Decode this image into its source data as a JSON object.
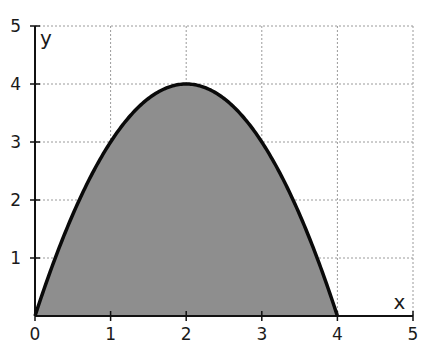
{
  "chart_data": {
    "type": "area",
    "title": "",
    "xlabel": "x",
    "ylabel": "y",
    "xlim": [
      0,
      5
    ],
    "ylim": [
      0,
      5
    ],
    "x_ticks": [
      0,
      1,
      2,
      3,
      4,
      5
    ],
    "y_ticks": [
      1,
      2,
      3,
      4,
      5
    ],
    "x_tick_labels": [
      "0",
      "1",
      "2",
      "3",
      "4",
      "5"
    ],
    "y_tick_labels": [
      "1",
      "2",
      "3",
      "4",
      "5"
    ],
    "grid": true,
    "grid_style": "dashed",
    "legend": null,
    "series": [
      {
        "name": "y = 4x - x^2",
        "function": "y = x(4 - x)",
        "shaded_region": "area between curve and x-axis from x=0 to x=4",
        "x": [
          0,
          0.5,
          1,
          1.5,
          2,
          2.5,
          3,
          3.5,
          4
        ],
        "values": [
          0,
          1.75,
          3,
          3.75,
          4,
          3.75,
          3,
          1.75,
          0
        ]
      }
    ],
    "annotations": []
  },
  "colors": {
    "fill": "#8e8e8e",
    "curve": "#0a0a0a",
    "axis": "#111111",
    "grid": "#9a9a9a",
    "background": "#ffffff"
  },
  "layout": {
    "origin_px": [
      35,
      316
    ],
    "x_unit_px": 75.6,
    "y_unit_px": 58
  }
}
